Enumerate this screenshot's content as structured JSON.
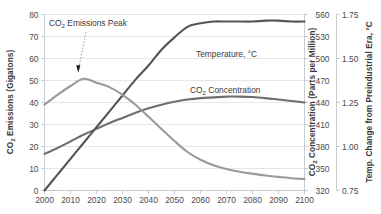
{
  "chart_data": {
    "type": "line",
    "title": "",
    "xlabel": "",
    "grid": "horizontal",
    "legend_position": "inline-labels",
    "x": [
      2000,
      2005,
      2010,
      2015,
      2020,
      2025,
      2030,
      2035,
      2040,
      2045,
      2050,
      2055,
      2060,
      2065,
      2070,
      2075,
      2080,
      2085,
      2090,
      2095,
      2100
    ],
    "xlim": [
      2000,
      2100
    ],
    "xticks": [
      2000,
      2010,
      2020,
      2030,
      2040,
      2050,
      2060,
      2070,
      2080,
      2090,
      2100
    ],
    "axes": [
      {
        "id": "left",
        "label": "CO2 Emissions (Gigatons)",
        "label_rich": [
          "CO",
          "2",
          " Emissions (Gigatons)"
        ],
        "ticks": [
          0,
          10,
          20,
          30,
          40,
          50,
          60,
          70,
          80
        ],
        "range": [
          0,
          80
        ],
        "side": "left"
      },
      {
        "id": "right-inner",
        "label": "CO2 Concentration (Parts per Million)",
        "label_rich": [
          "CO",
          "2",
          " Concentration (Parts per Million)"
        ],
        "ticks": [
          320,
          350,
          380,
          410,
          440,
          470,
          500,
          530,
          560
        ],
        "range": [
          320,
          560
        ],
        "side": "right"
      },
      {
        "id": "right-outer",
        "label": "Temp. Change from Preindustrial Era, °C",
        "ticks": [
          "0.75",
          "1.00",
          "1.25",
          "1.50",
          "1.75"
        ],
        "range": [
          0.75,
          1.75
        ],
        "side": "right"
      }
    ],
    "series": [
      {
        "name": "CO2 Emissions",
        "axis": "left",
        "units": "Gigatons",
        "color": "#9a9a9a",
        "values": [
          39.0,
          43.5,
          47.5,
          50.8,
          49.0,
          47.0,
          43.5,
          39.0,
          33.5,
          28.0,
          22.5,
          17.5,
          14.0,
          11.5,
          9.8,
          8.5,
          7.6,
          6.8,
          6.2,
          5.6,
          5.2
        ]
      },
      {
        "name": "Temperature, °C",
        "axis": "right-outer",
        "units": "°C",
        "color": "#555555",
        "values": [
          0.75,
          0.84,
          0.93,
          1.02,
          1.11,
          1.2,
          1.29,
          1.38,
          1.46,
          1.55,
          1.62,
          1.68,
          1.7,
          1.71,
          1.71,
          1.71,
          1.71,
          1.715,
          1.715,
          1.71,
          1.71
        ]
      },
      {
        "name": "CO2 Concentration",
        "axis": "right-inner",
        "units": "Parts per Million",
        "color": "#6e6e6e",
        "values": [
          370,
          378,
          387,
          396,
          404,
          412,
          419,
          426,
          432,
          437,
          441,
          444,
          446,
          447,
          448,
          448,
          447.5,
          446,
          444,
          442,
          440
        ]
      }
    ],
    "annotations": [
      {
        "text": "CO2 Emissions Peak",
        "text_rich": [
          "CO",
          "2",
          " Emissions Peak"
        ],
        "points_to_x": 2013,
        "points_to_y": 51,
        "style": "dotted-leader-with-arrow"
      }
    ],
    "series_labels": [
      {
        "text": "Temperature, °C",
        "series": "Temperature, °C"
      },
      {
        "text": "CO2 Concentration",
        "text_rich": [
          "CO",
          "2",
          " Concentration"
        ],
        "series": "CO2 Concentration"
      }
    ],
    "colors": {
      "emissions": "#9a9a9a",
      "temperature": "#555555",
      "concentration": "#6e6e6e",
      "gridline": "#d8dde2",
      "axis": "#b9c0c6",
      "text": "#3b3b3b",
      "background": "#ffffff"
    }
  }
}
